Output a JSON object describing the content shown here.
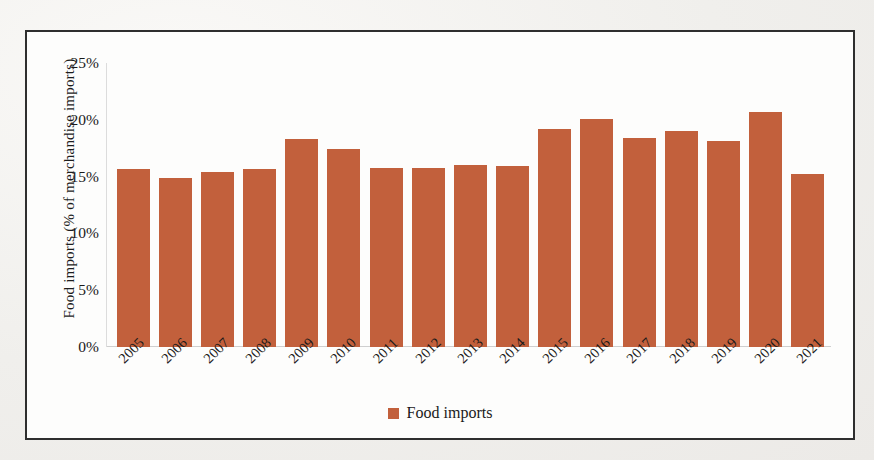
{
  "figure": {
    "bar_color": "#C2603C",
    "frame_color": "#2E2E2E",
    "page_background": "#F1F0EE"
  },
  "legend": {
    "position": "bottom-center",
    "entries": [
      {
        "label": "Food imports",
        "color": "#C2603C",
        "marker": "square-marker"
      }
    ]
  },
  "chart_data": {
    "type": "bar",
    "title": "",
    "xlabel": "",
    "ylabel": "Food imports (% of merchandise imports)",
    "ylim": [
      0,
      25
    ],
    "ytick_labels": [
      "25%",
      "20%",
      "15%",
      "10%",
      "5%",
      "0%"
    ],
    "ytick_values": [
      25,
      20,
      15,
      10,
      5,
      0
    ],
    "grid": false,
    "legend_position": "bottom-center",
    "categories": [
      "2005",
      "2006",
      "2007",
      "2008",
      "2009",
      "2010",
      "2011",
      "2012",
      "2013",
      "2014",
      "2015",
      "2016",
      "2017",
      "2018",
      "2019",
      "2020",
      "2021"
    ],
    "series": [
      {
        "name": "Food imports",
        "color": "#C2603C",
        "values": [
          15.7,
          14.9,
          15.4,
          15.7,
          18.3,
          17.4,
          15.8,
          15.8,
          16.0,
          15.9,
          19.2,
          20.1,
          18.4,
          19.0,
          18.1,
          20.7,
          15.2
        ]
      }
    ]
  }
}
